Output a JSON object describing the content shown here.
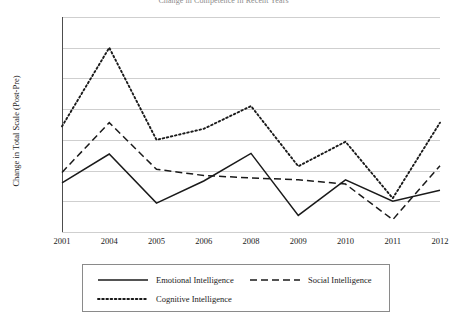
{
  "chart_data": {
    "type": "line",
    "title": "Change in Competence in Recent Years",
    "xlabel": "",
    "ylabel": "Change in Total Scale (Post-Pre)",
    "categories": [
      "2001",
      "2004",
      "2005",
      "2006",
      "2008",
      "2009",
      "2010",
      "2011",
      "2012"
    ],
    "ylim": [
      0,
      3.5
    ],
    "yticks": [
      "0",
      "0.5",
      "1",
      "1.5",
      "2",
      "2.5",
      "3",
      "3.5"
    ],
    "ytick_values": [
      0,
      0.5,
      1,
      1.5,
      2,
      2.5,
      3,
      3.5
    ],
    "grid": true,
    "legend_position": "bottom",
    "series": [
      {
        "name": "Emotional Intelligence",
        "style": "solid",
        "color": "#1a1a1a",
        "values": [
          0.8,
          1.27,
          0.47,
          0.83,
          1.28,
          0.27,
          0.85,
          0.5,
          0.68
        ]
      },
      {
        "name": "Social Intelligence",
        "style": "dashed",
        "color": "#1a1a1a",
        "values": [
          0.97,
          1.78,
          1.02,
          0.92,
          0.88,
          0.85,
          0.78,
          0.2,
          1.08
        ]
      },
      {
        "name": "Cognitive Intelligence",
        "style": "dotted",
        "color": "#1a1a1a",
        "values": [
          1.72,
          3.0,
          1.5,
          1.68,
          2.05,
          1.07,
          1.47,
          0.55,
          1.78
        ]
      }
    ]
  },
  "axis": {
    "gridline_color": "#cfcfcf",
    "axis_color": "#4d4d4d"
  }
}
